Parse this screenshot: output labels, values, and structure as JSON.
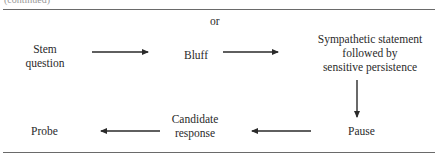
{
  "caption_fragment": "(continued)",
  "top_label": "or",
  "nodes": {
    "stem_question": [
      "Stem",
      "question"
    ],
    "bluff": "Bluff",
    "sympathetic": [
      "Sympathetic statement",
      "followed by",
      "sensitive persistence"
    ],
    "pause": "Pause",
    "candidate_response": [
      "Candidate",
      "response"
    ],
    "probe": "Probe"
  },
  "edges": [
    {
      "from": "Stem question",
      "to": "Bluff"
    },
    {
      "from": "Bluff",
      "to": "Sympathetic statement followed by sensitive persistence"
    },
    {
      "from": "Sympathetic statement followed by sensitive persistence",
      "to": "Pause"
    },
    {
      "from": "Pause",
      "to": "Candidate response"
    },
    {
      "from": "Candidate response",
      "to": "Probe"
    }
  ]
}
